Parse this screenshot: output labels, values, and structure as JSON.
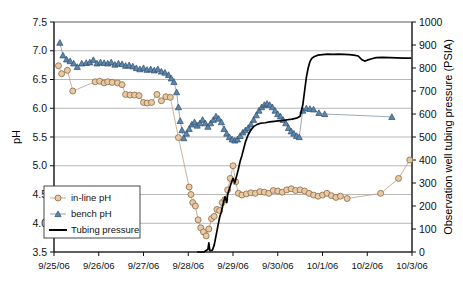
{
  "chart_data": {
    "type": "line",
    "title": "",
    "xlabel": "",
    "ylabel": "pH",
    "y2label": "Observation well tubing pressure (PSIA)",
    "grid": true,
    "legend_position": "inside-lower-left",
    "x_tick_labels": [
      "9/25/06",
      "9/26/06",
      "9/27/06",
      "9/28/06",
      "9/29/06",
      "9/30/06",
      "10/1/06",
      "10/2/06",
      "10/3/06"
    ],
    "x_range_days": [
      0,
      8
    ],
    "ylim": [
      3.5,
      7.5
    ],
    "y_tick_labels": [
      "3.5",
      "4.0",
      "4.5",
      "5.0",
      "5.5",
      "6.0",
      "6.5",
      "7.0",
      "7.5"
    ],
    "y2lim": [
      0,
      1000
    ],
    "y2_tick_labels": [
      "0",
      "100",
      "200",
      "300",
      "400",
      "500",
      "600",
      "700",
      "800",
      "900",
      "1000"
    ],
    "colors": {
      "inline_marker_fill": "#e8c9a4",
      "inline_marker_stroke": "#8a6a45",
      "bench_marker_fill": "#5b86ad",
      "bench_marker_stroke": "#2e4d6b",
      "pressure_line": "#000000",
      "gridline": "#9a9a9a"
    },
    "series": [
      {
        "name": "in-line pH",
        "axis": "left",
        "marker": "circle",
        "points": [
          [
            0.1,
            6.74
          ],
          [
            0.17,
            6.6
          ],
          [
            0.3,
            6.66
          ],
          [
            0.42,
            6.3
          ],
          [
            0.92,
            6.46
          ],
          [
            1.02,
            6.47
          ],
          [
            1.12,
            6.44
          ],
          [
            1.2,
            6.46
          ],
          [
            1.3,
            6.45
          ],
          [
            1.42,
            6.44
          ],
          [
            1.52,
            6.41
          ],
          [
            1.6,
            6.24
          ],
          [
            1.7,
            6.23
          ],
          [
            1.8,
            6.23
          ],
          [
            1.9,
            6.22
          ],
          [
            2.0,
            6.1
          ],
          [
            2.08,
            6.09
          ],
          [
            2.18,
            6.1
          ],
          [
            2.3,
            6.24
          ],
          [
            2.4,
            6.13
          ],
          [
            2.5,
            6.2
          ],
          [
            2.6,
            6.19
          ],
          [
            2.78,
            5.49
          ],
          [
            3.02,
            4.63
          ],
          [
            3.06,
            4.5
          ],
          [
            3.1,
            4.36
          ],
          [
            3.16,
            4.3
          ],
          [
            3.22,
            4.06
          ],
          [
            3.28,
            3.92
          ],
          [
            3.34,
            3.85
          ],
          [
            3.4,
            3.78
          ],
          [
            3.46,
            3.9
          ],
          [
            3.52,
            4.08
          ],
          [
            3.58,
            4.12
          ],
          [
            3.64,
            4.24
          ],
          [
            3.7,
            4.22
          ],
          [
            3.76,
            4.36
          ],
          [
            3.82,
            4.41
          ],
          [
            3.88,
            4.58
          ],
          [
            3.94,
            4.78
          ],
          [
            4.0,
            5.0
          ],
          [
            4.06,
            4.72
          ],
          [
            4.12,
            4.52
          ],
          [
            4.2,
            4.49
          ],
          [
            4.3,
            4.51
          ],
          [
            4.4,
            4.53
          ],
          [
            4.5,
            4.52
          ],
          [
            4.6,
            4.55
          ],
          [
            4.7,
            4.54
          ],
          [
            4.8,
            4.52
          ],
          [
            4.9,
            4.57
          ],
          [
            5.0,
            4.56
          ],
          [
            5.1,
            4.54
          ],
          [
            5.2,
            4.58
          ],
          [
            5.3,
            4.6
          ],
          [
            5.4,
            4.57
          ],
          [
            5.5,
            4.58
          ],
          [
            5.6,
            4.56
          ],
          [
            5.7,
            4.52
          ],
          [
            5.8,
            4.49
          ],
          [
            5.9,
            4.47
          ],
          [
            6.0,
            4.49
          ],
          [
            6.1,
            4.52
          ],
          [
            6.2,
            4.48
          ],
          [
            6.3,
            4.45
          ],
          [
            6.4,
            4.47
          ],
          [
            6.55,
            4.43
          ],
          [
            7.3,
            4.52
          ],
          [
            7.7,
            4.78
          ],
          [
            7.95,
            5.1
          ]
        ]
      },
      {
        "name": "bench pH",
        "axis": "left",
        "marker": "triangle",
        "points": [
          [
            0.13,
            7.14
          ],
          [
            0.2,
            6.92
          ],
          [
            0.28,
            6.85
          ],
          [
            0.36,
            6.82
          ],
          [
            0.44,
            6.78
          ],
          [
            0.52,
            6.72
          ],
          [
            0.62,
            6.78
          ],
          [
            0.72,
            6.79
          ],
          [
            0.8,
            6.8
          ],
          [
            0.88,
            6.84
          ],
          [
            0.96,
            6.78
          ],
          [
            1.04,
            6.8
          ],
          [
            1.12,
            6.79
          ],
          [
            1.2,
            6.78
          ],
          [
            1.28,
            6.8
          ],
          [
            1.36,
            6.76
          ],
          [
            1.44,
            6.78
          ],
          [
            1.52,
            6.77
          ],
          [
            1.6,
            6.74
          ],
          [
            1.68,
            6.75
          ],
          [
            1.76,
            6.73
          ],
          [
            1.84,
            6.7
          ],
          [
            1.92,
            6.68
          ],
          [
            2.0,
            6.7
          ],
          [
            2.08,
            6.67
          ],
          [
            2.16,
            6.68
          ],
          [
            2.24,
            6.66
          ],
          [
            2.32,
            6.68
          ],
          [
            2.4,
            6.64
          ],
          [
            2.48,
            6.62
          ],
          [
            2.56,
            6.58
          ],
          [
            2.62,
            6.52
          ],
          [
            2.68,
            6.46
          ],
          [
            2.74,
            6.28
          ],
          [
            2.78,
            6.02
          ],
          [
            2.82,
            5.78
          ],
          [
            2.86,
            5.62
          ],
          [
            2.9,
            5.48
          ],
          [
            2.96,
            5.56
          ],
          [
            3.02,
            5.64
          ],
          [
            3.08,
            5.72
          ],
          [
            3.14,
            5.76
          ],
          [
            3.2,
            5.7
          ],
          [
            3.26,
            5.74
          ],
          [
            3.32,
            5.8
          ],
          [
            3.38,
            5.74
          ],
          [
            3.44,
            5.68
          ],
          [
            3.5,
            5.74
          ],
          [
            3.56,
            5.8
          ],
          [
            3.62,
            5.86
          ],
          [
            3.68,
            5.82
          ],
          [
            3.74,
            5.76
          ],
          [
            3.8,
            5.64
          ],
          [
            3.86,
            5.56
          ],
          [
            3.92,
            5.5
          ],
          [
            3.98,
            5.46
          ],
          [
            4.04,
            5.44
          ],
          [
            4.1,
            5.46
          ],
          [
            4.16,
            5.52
          ],
          [
            4.22,
            5.58
          ],
          [
            4.28,
            5.62
          ],
          [
            4.34,
            5.66
          ],
          [
            4.4,
            5.72
          ],
          [
            4.46,
            5.8
          ],
          [
            4.52,
            5.88
          ],
          [
            4.58,
            5.96
          ],
          [
            4.64,
            6.02
          ],
          [
            4.7,
            6.06
          ],
          [
            4.76,
            6.08
          ],
          [
            4.82,
            6.06
          ],
          [
            4.88,
            6.02
          ],
          [
            4.94,
            5.96
          ],
          [
            5.0,
            5.9
          ],
          [
            5.06,
            5.86
          ],
          [
            5.12,
            5.8
          ],
          [
            5.18,
            5.74
          ],
          [
            5.24,
            5.66
          ],
          [
            5.3,
            5.6
          ],
          [
            5.36,
            5.56
          ],
          [
            5.42,
            5.52
          ],
          [
            5.48,
            5.5
          ],
          [
            5.56,
            5.96
          ],
          [
            5.64,
            6.0
          ],
          [
            5.72,
            5.99
          ],
          [
            5.8,
            5.98
          ],
          [
            5.92,
            5.92
          ],
          [
            6.05,
            5.9
          ],
          [
            7.55,
            5.85
          ]
        ]
      },
      {
        "name": "Tubing pressure",
        "axis": "right",
        "marker": "none",
        "points": [
          [
            3.2,
            0
          ],
          [
            3.35,
            0
          ],
          [
            3.44,
            12
          ],
          [
            3.46,
            40
          ],
          [
            3.48,
            8
          ],
          [
            3.5,
            6
          ],
          [
            3.54,
            8
          ],
          [
            3.58,
            30
          ],
          [
            3.62,
            70
          ],
          [
            3.66,
            110
          ],
          [
            3.7,
            150
          ],
          [
            3.74,
            175
          ],
          [
            3.78,
            210
          ],
          [
            3.82,
            240
          ],
          [
            3.86,
            215
          ],
          [
            3.88,
            250
          ],
          [
            3.92,
            275
          ],
          [
            3.96,
            300
          ],
          [
            4.0,
            320
          ],
          [
            4.04,
            300
          ],
          [
            4.08,
            330
          ],
          [
            4.12,
            360
          ],
          [
            4.16,
            395
          ],
          [
            4.2,
            420
          ],
          [
            4.24,
            450
          ],
          [
            4.28,
            480
          ],
          [
            4.34,
            510
          ],
          [
            4.4,
            530
          ],
          [
            4.46,
            545
          ],
          [
            4.54,
            555
          ],
          [
            4.62,
            560
          ],
          [
            4.72,
            562
          ],
          [
            4.82,
            566
          ],
          [
            4.92,
            568
          ],
          [
            5.02,
            570
          ],
          [
            5.12,
            572
          ],
          [
            5.22,
            575
          ],
          [
            5.32,
            578
          ],
          [
            5.42,
            582
          ],
          [
            5.5,
            590
          ],
          [
            5.56,
            640
          ],
          [
            5.6,
            700
          ],
          [
            5.64,
            760
          ],
          [
            5.68,
            800
          ],
          [
            5.72,
            828
          ],
          [
            5.76,
            842
          ],
          [
            5.82,
            850
          ],
          [
            5.9,
            856
          ],
          [
            6.0,
            858
          ],
          [
            6.12,
            860
          ],
          [
            6.24,
            859
          ],
          [
            6.36,
            860
          ],
          [
            6.48,
            859
          ],
          [
            6.6,
            858
          ],
          [
            6.7,
            856
          ],
          [
            6.8,
            852
          ],
          [
            6.88,
            836
          ],
          [
            6.94,
            830
          ],
          [
            7.0,
            834
          ],
          [
            7.1,
            840
          ],
          [
            7.2,
            845
          ],
          [
            7.34,
            846
          ],
          [
            7.5,
            845
          ],
          [
            7.66,
            844
          ],
          [
            7.82,
            843
          ],
          [
            7.98,
            843
          ]
        ]
      }
    ],
    "legend_entries": [
      {
        "label": "in-line pH",
        "marker": "circle"
      },
      {
        "label": "bench pH",
        "marker": "triangle"
      },
      {
        "label": "Tubing pressure",
        "marker": "line"
      }
    ]
  }
}
